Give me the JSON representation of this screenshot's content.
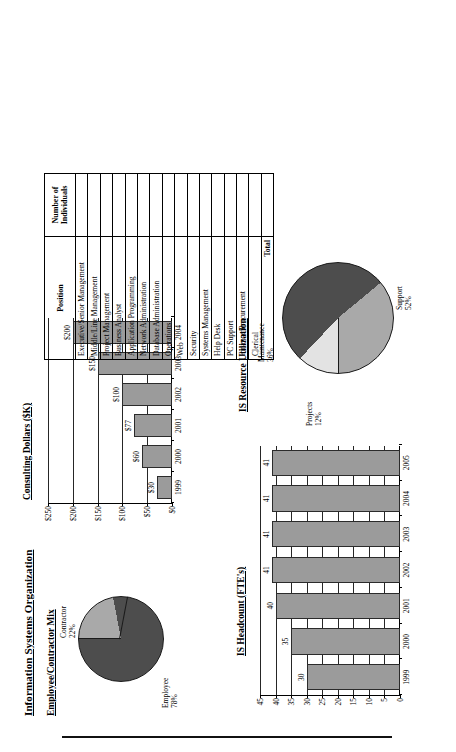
{
  "document": {
    "title": "Information Systems Organization"
  },
  "panels": {
    "employee_contractor_mix": {
      "title": "Employee/Contractor Mix"
    },
    "consulting_dollars": {
      "title": "Consulting Dollars ($K)"
    },
    "is_headcount": {
      "title": "IS Headcount (FTE's)"
    },
    "is_resource_utilization": {
      "title": "IS Resource Utilization"
    },
    "staffing_table": {
      "title": ""
    }
  },
  "chart_data": [
    {
      "id": "employee-contractor-mix",
      "type": "pie",
      "title": "Employee/Contractor Mix",
      "labels": [
        "Employee",
        "Contractor"
      ],
      "values": [
        78,
        22
      ],
      "value_labels": [
        "78%",
        "22%"
      ],
      "colors": [
        "#4d4d4d",
        "#a9a9a9"
      ],
      "legend": "labels-outside"
    },
    {
      "id": "consulting-dollars",
      "type": "bar",
      "title": "Consulting Dollars ($K)",
      "categories": [
        "1999",
        "2000",
        "2001",
        "2002",
        "2003",
        "2004"
      ],
      "values": [
        30,
        60,
        77,
        100,
        150,
        200
      ],
      "data_labels": [
        "$30",
        "$60",
        "$77",
        "$100",
        "$150",
        "$200"
      ],
      "ylim": [
        0,
        250
      ],
      "yticks": [
        0,
        50,
        100,
        150,
        200,
        250
      ],
      "ytick_labels": [
        "$0",
        "$50",
        "$100",
        "$150",
        "$200",
        "$250"
      ],
      "xlabel": "",
      "ylabel": "",
      "grid": true,
      "bar_color": "#9b9b9b"
    },
    {
      "id": "is-headcount",
      "type": "bar",
      "title": "IS Headcount (FTE's)",
      "categories": [
        "1999",
        "2000",
        "2001",
        "2002",
        "2003",
        "2004",
        "2005"
      ],
      "values": [
        30,
        35,
        40,
        41,
        41,
        41,
        41
      ],
      "data_labels": [
        "30",
        "35",
        "40",
        "41",
        "41",
        "41",
        "41"
      ],
      "ylim": [
        0,
        45
      ],
      "yticks": [
        0,
        5,
        10,
        15,
        20,
        25,
        30,
        35,
        40,
        45
      ],
      "ytick_labels": [
        "0",
        "5",
        "10",
        "15",
        "20",
        "25",
        "30",
        "35",
        "40",
        "45"
      ],
      "xlabel": "",
      "ylabel": "",
      "grid": true,
      "bar_color": "#9b9b9b"
    },
    {
      "id": "is-resource-utilization",
      "type": "pie",
      "title": "IS Resource Utilization",
      "labels": [
        "Support",
        "Maintenance",
        "Projects"
      ],
      "values": [
        52,
        36,
        12
      ],
      "value_labels": [
        "52%",
        "36%",
        "12%"
      ],
      "colors": [
        "#4d4d4d",
        "#a9a9a9",
        "#e3e3e3"
      ],
      "legend": "labels-outside"
    }
  ],
  "table": {
    "columns": [
      "Position",
      "Number of Individuals"
    ],
    "rows": [
      {
        "position": "Executive/Senior Management",
        "count": ""
      },
      {
        "position": "Middle/Line Management",
        "count": ""
      },
      {
        "position": "Project Management",
        "count": ""
      },
      {
        "position": "Business Analyst",
        "count": ""
      },
      {
        "position": "Application Programming",
        "count": ""
      },
      {
        "position": "Network Administration",
        "count": ""
      },
      {
        "position": "Database Administration",
        "count": ""
      },
      {
        "position": "Operations",
        "count": ""
      },
      {
        "position": "Web",
        "count": ""
      },
      {
        "position": "Security",
        "count": ""
      },
      {
        "position": "Systems Management",
        "count": ""
      },
      {
        "position": "Help Desk",
        "count": ""
      },
      {
        "position": "PC Support",
        "count": ""
      },
      {
        "position": "Finance/Procurement",
        "count": ""
      },
      {
        "position": "Clerical",
        "count": ""
      }
    ],
    "total_label": "Total",
    "total_count": ""
  },
  "colors": {
    "bar_fill": "#9b9b9b",
    "pie_dark": "#4d4d4d",
    "pie_medium": "#a9a9a9",
    "pie_light": "#e3e3e3",
    "ink": "#000000"
  }
}
